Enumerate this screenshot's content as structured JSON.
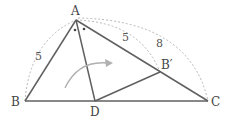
{
  "diagram": {
    "type": "geometry-triangle-fold",
    "points": {
      "A": {
        "label": "A",
        "x": 76,
        "y": 20
      },
      "B": {
        "label": "B",
        "x": 25,
        "y": 101
      },
      "C": {
        "label": "C",
        "x": 208,
        "y": 101
      },
      "D": {
        "label": "D",
        "x": 95,
        "y": 101
      },
      "Bp": {
        "label": "B′",
        "x": 160,
        "y": 72
      }
    },
    "segments": [
      {
        "from": "A",
        "to": "B"
      },
      {
        "from": "A",
        "to": "C"
      },
      {
        "from": "B",
        "to": "C"
      },
      {
        "from": "A",
        "to": "D"
      },
      {
        "from": "D",
        "to": "Bp"
      }
    ],
    "lengths": {
      "AB": "5",
      "ABp": "5",
      "AC": "8"
    },
    "angle_marks": "equal angles BAD and DAB′ (dots)",
    "arrow": "fold arrow from triangle ABD onto ADB′",
    "colors": {
      "line": "#606060",
      "dashed_arc": "#b8b8b8",
      "arrow": "#b0b0b0",
      "text": "#444444"
    }
  }
}
